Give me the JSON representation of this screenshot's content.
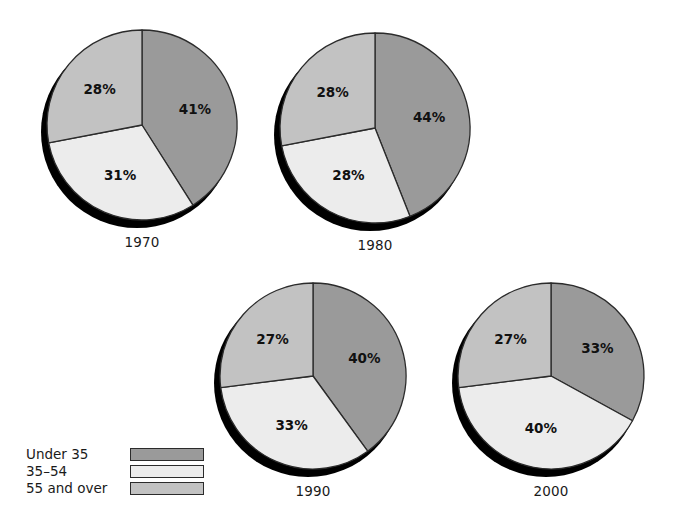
{
  "chart_data": {
    "type": "pie",
    "title": "",
    "subtitle": "",
    "xlabel": "",
    "ylabel": "",
    "value_suffix": "%",
    "start_angle_deg": 0,
    "direction": "clockwise",
    "legend_position": "bottom-left",
    "grid": false,
    "categories": [
      "Under 35",
      "35–54",
      "55 and over"
    ],
    "colors": [
      "#9a9a9a",
      "#ececec",
      "#c2c2c2"
    ],
    "shadow_color": "#000000",
    "outline_color": "#2b2b2b",
    "charts": [
      {
        "id": "pie-1970",
        "year": "1970",
        "values": [
          41,
          31,
          28
        ],
        "labels": [
          "41%",
          "31%",
          "28%"
        ],
        "center_x": 142,
        "center_y": 125,
        "radius": 95
      },
      {
        "id": "pie-1980",
        "year": "1980",
        "values": [
          44,
          28,
          28
        ],
        "labels": [
          "44%",
          "28%",
          "28%"
        ],
        "center_x": 375,
        "center_y": 128,
        "radius": 95
      },
      {
        "id": "pie-1990",
        "year": "1990",
        "values": [
          40,
          33,
          27
        ],
        "labels": [
          "40%",
          "33%",
          "27%"
        ],
        "center_x": 313,
        "center_y": 376,
        "radius": 93
      },
      {
        "id": "pie-2000",
        "year": "2000",
        "values": [
          33,
          40,
          27
        ],
        "labels": [
          "33%",
          "40%",
          "27%"
        ],
        "center_x": 551,
        "center_y": 376,
        "radius": 93
      }
    ]
  },
  "legend": {
    "items": [
      {
        "label": "Under 35",
        "color": "#9a9a9a"
      },
      {
        "label": "35–54",
        "color": "#ececec"
      },
      {
        "label": "55 and over",
        "color": "#c2c2c2"
      }
    ]
  },
  "years": {
    "y1970": "1970",
    "y1980": "1980",
    "y1990": "1990",
    "y2000": "2000"
  }
}
